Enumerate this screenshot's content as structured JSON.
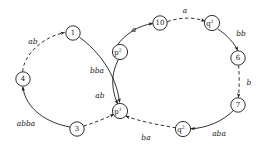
{
  "diagram": {
    "title": "",
    "type": "state-transition-graph",
    "colors": {
      "stroke": "#1a1a1a",
      "background": "#ffffff",
      "node_fill": "#ffffff"
    },
    "nodes": [
      {
        "id": "n1",
        "label": "1",
        "sup": "",
        "cx": 73,
        "cy": 33,
        "r": 7.2
      },
      {
        "id": "n4",
        "label": "4",
        "sup": "",
        "cx": 23,
        "cy": 79,
        "r": 7.2
      },
      {
        "id": "n3",
        "label": "3",
        "sup": "",
        "cx": 77,
        "cy": 129,
        "r": 7.2
      },
      {
        "id": "p2",
        "label": "p",
        "sup": "2",
        "cx": 120,
        "cy": 52,
        "r": 7.6
      },
      {
        "id": "p1",
        "label": "p",
        "sup": "1",
        "cx": 120,
        "cy": 111,
        "r": 7.6
      },
      {
        "id": "n10",
        "label": "10",
        "sup": "",
        "cx": 160,
        "cy": 23,
        "r": 7.2
      },
      {
        "id": "q1",
        "label": "q",
        "sup": "1",
        "cx": 212,
        "cy": 23,
        "r": 7.6
      },
      {
        "id": "n6",
        "label": "6",
        "sup": "",
        "cx": 238,
        "cy": 58,
        "r": 7.2
      },
      {
        "id": "n7",
        "label": "7",
        "sup": "",
        "cx": 238,
        "cy": 105,
        "r": 7.2
      },
      {
        "id": "q2",
        "label": "q",
        "sup": "2",
        "cx": 183,
        "cy": 129,
        "r": 7.6
      }
    ],
    "edges": [
      {
        "id": "e1",
        "from": "n4",
        "to": "n1",
        "label": "ab",
        "style": "dashed",
        "label_x": 33,
        "label_y": 41
      },
      {
        "id": "e2",
        "from": "n1",
        "to": "p1",
        "label": "bba",
        "style": "solid",
        "label_x": 97,
        "label_y": 70
      },
      {
        "id": "e3",
        "from": "n3",
        "to": "p1",
        "label": "ab",
        "style": "dashed",
        "label_x": 100,
        "label_y": 95
      },
      {
        "id": "e4",
        "from": "n3",
        "to": "n4",
        "label": "abba",
        "style": "solid",
        "label_x": 26,
        "label_y": 123
      },
      {
        "id": "e5",
        "from": "p2",
        "to": "n10",
        "label": "a",
        "style": "solid",
        "label_x": 134,
        "label_y": 29
      },
      {
        "id": "e6",
        "from": "n10",
        "to": "q1",
        "label": "a",
        "style": "dashed",
        "label_x": 185,
        "label_y": 10
      },
      {
        "id": "e7",
        "from": "q1",
        "to": "n6",
        "label": "bb",
        "style": "solid",
        "label_x": 240,
        "label_y": 33
      },
      {
        "id": "e8",
        "from": "n6",
        "to": "n7",
        "label": "b",
        "style": "dashed",
        "label_x": 247,
        "label_y": 82
      },
      {
        "id": "e9",
        "from": "n7",
        "to": "q2",
        "label": "aba",
        "style": "solid",
        "label_x": 219,
        "label_y": 133
      },
      {
        "id": "e10",
        "from": "q2",
        "to": "p1",
        "label": "ba",
        "style": "dashed",
        "label_x": 146,
        "label_y": 137
      },
      {
        "id": "e11",
        "from": "p2",
        "to": "p1",
        "label": "",
        "style": "solid",
        "label_x": 0,
        "label_y": 0
      }
    ]
  }
}
